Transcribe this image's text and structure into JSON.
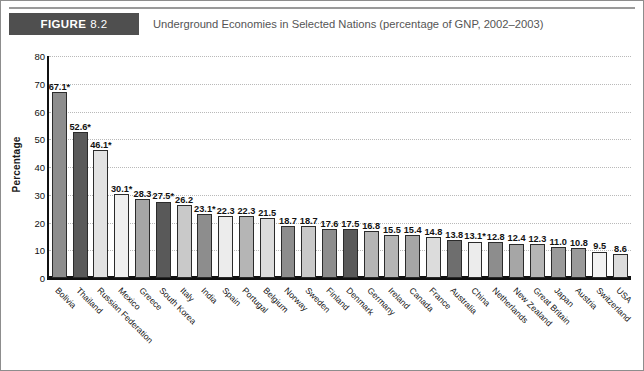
{
  "header": {
    "figure_word": "FIGURE",
    "figure_number": "8.2",
    "title": "Underground Economies in Selected Nations (percentage of GNP, 2002–2003)"
  },
  "chart_data": {
    "type": "bar",
    "title": "Underground Economies in Selected Nations (percentage of GNP, 2002–2003)",
    "xlabel": "",
    "ylabel": "Percentage",
    "ylim": [
      0,
      80
    ],
    "yticks": [
      0,
      10,
      20,
      30,
      40,
      50,
      60,
      70,
      80
    ],
    "grid": true,
    "legend": "none",
    "categories": [
      "Bolivia",
      "Thailand",
      "Russian Federation",
      "Mexico",
      "Greece",
      "South Korea",
      "Italy",
      "India",
      "Spain",
      "Portugal",
      "Belgium",
      "Norway",
      "Sweden",
      "Finland",
      "Denmark",
      "Germany",
      "Ireland",
      "Canada",
      "France",
      "Australia",
      "China",
      "Netherlands",
      "New Zealand",
      "Great Britain",
      "Japan",
      "Austria",
      "Switzerland",
      "USA"
    ],
    "values": [
      67.1,
      52.6,
      46.1,
      30.1,
      28.3,
      27.5,
      26.2,
      23.1,
      22.3,
      22.3,
      21.5,
      18.7,
      18.7,
      17.6,
      17.5,
      16.8,
      15.5,
      15.4,
      14.8,
      13.8,
      13.1,
      12.8,
      12.4,
      12.3,
      11.0,
      10.8,
      9.5,
      8.6
    ],
    "value_labels": [
      "67.1*",
      "52.6*",
      "46.1*",
      "30.1*",
      "28.3",
      "27.5*",
      "26.2",
      "23.1*",
      "22.3",
      "22.3",
      "21.5",
      "18.7",
      "18.7",
      "17.6",
      "17.5",
      "16.8",
      "15.5",
      "15.4",
      "14.8",
      "13.8",
      "13.1*",
      "12.8",
      "12.4",
      "12.3",
      "11.0",
      "10.8",
      "9.5",
      "8.6"
    ],
    "bar_colors": [
      "#8d8d8d",
      "#5a5a5a",
      "#e2e2e2",
      "#f0f0f0",
      "#a6a6a6",
      "#595959",
      "#c9c9c9",
      "#8d8d8d",
      "#ececec",
      "#b5b5b5",
      "#dcdcdc",
      "#8d8d8d",
      "#c9c9c9",
      "#8d8d8d",
      "#5a5a5a",
      "#b5b5b5",
      "#b5b5b5",
      "#a6a6a6",
      "#dcdcdc",
      "#6e6e6e",
      "#ececec",
      "#8d8d8d",
      "#a6a6a6",
      "#b5b5b5",
      "#9a9a9a",
      "#9a9a9a",
      "#f2f2f2",
      "#dcdcdc"
    ],
    "footnote_marker": "*"
  },
  "axis": {
    "y_title": "Percentage",
    "tick_0": "0",
    "tick_10": "10",
    "tick_20": "20",
    "tick_30": "30",
    "tick_40": "40",
    "tick_50": "50",
    "tick_60": "60",
    "tick_70": "70",
    "tick_80": "80"
  }
}
